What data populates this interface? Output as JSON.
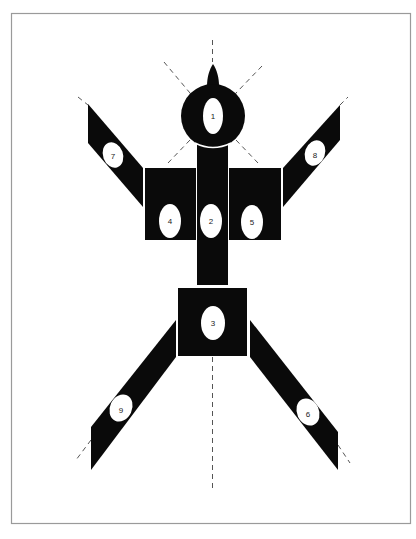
{
  "figure": {
    "colors": {
      "background": "#ffffff",
      "frame": "#9a9a9a",
      "shape_fill": "#0a0a0a",
      "ellipse_fill": "#ffffff",
      "dash": "#555555",
      "label": "#222222"
    },
    "parts": [
      {
        "id": "head",
        "label": "1"
      },
      {
        "id": "torso",
        "label": "2"
      },
      {
        "id": "pelvis",
        "label": "3"
      },
      {
        "id": "left-chest",
        "label": "4"
      },
      {
        "id": "right-chest",
        "label": "5"
      },
      {
        "id": "right-leg",
        "label": "6"
      },
      {
        "id": "left-arm",
        "label": "7"
      },
      {
        "id": "right-arm",
        "label": "8"
      },
      {
        "id": "left-leg",
        "label": "9"
      }
    ],
    "labels": {
      "head": "1",
      "torso": "2",
      "pelvis": "3",
      "left_chest": "4",
      "right_chest": "5",
      "right_leg": "6",
      "left_arm": "7",
      "right_arm": "8",
      "left_leg": "9"
    }
  }
}
